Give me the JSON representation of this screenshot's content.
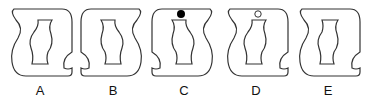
{
  "figure": {
    "type": "visual-reasoning-options",
    "stroke_color": "#333333",
    "filled_dot_color": "#000000",
    "hollow_dot_color": "#ffffff",
    "options": [
      {
        "label": "A",
        "orientation": "base",
        "dot": "none"
      },
      {
        "label": "B",
        "orientation": "mirrored-horizontal",
        "dot": "none"
      },
      {
        "label": "C",
        "orientation": "mirrored-horizontal",
        "dot": "filled"
      },
      {
        "label": "D",
        "orientation": "base",
        "dot": "hollow"
      },
      {
        "label": "E",
        "orientation": "base",
        "dot": "none"
      }
    ]
  }
}
